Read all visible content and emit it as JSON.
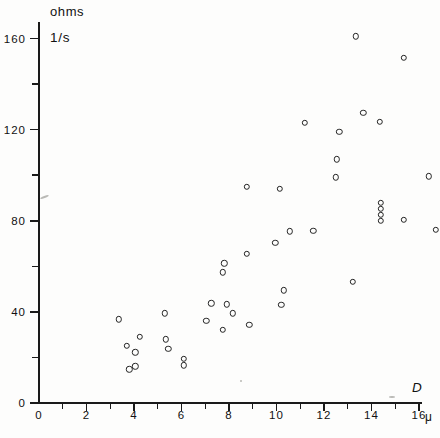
{
  "chart_data": {
    "type": "scatter",
    "title": "",
    "ylabel": "ohms",
    "ylabel_secondary": "1/s",
    "xlabel": "D",
    "xunit": "μ",
    "xlim": [
      0,
      16.8
    ],
    "ylim": [
      0,
      172
    ],
    "grid": false,
    "legend": null,
    "x_ticks_major": [
      0,
      2,
      4,
      6,
      8,
      10,
      12,
      14,
      16
    ],
    "x_ticks_minor": [
      1,
      3,
      5,
      7,
      9,
      11,
      13,
      15
    ],
    "y_ticks_major": [
      0,
      40,
      80,
      120,
      160
    ],
    "y_ticks_minor": [
      20,
      60,
      100,
      140
    ],
    "marker": "open-circle",
    "marker_color": "#242424",
    "points": [
      {
        "x": 3.35,
        "y": 36.7
      },
      {
        "x": 3.7,
        "y": 25.0
      },
      {
        "x": 3.8,
        "y": 14.8
      },
      {
        "x": 4.05,
        "y": 22.2
      },
      {
        "x": 4.25,
        "y": 29.0
      },
      {
        "x": 4.05,
        "y": 16.1
      },
      {
        "x": 5.3,
        "y": 39.3
      },
      {
        "x": 5.35,
        "y": 28.0
      },
      {
        "x": 5.45,
        "y": 23.9
      },
      {
        "x": 6.1,
        "y": 19.5
      },
      {
        "x": 6.1,
        "y": 16.5
      },
      {
        "x": 7.25,
        "y": 43.8
      },
      {
        "x": 7.9,
        "y": 43.3
      },
      {
        "x": 7.05,
        "y": 36.2
      },
      {
        "x": 8.15,
        "y": 39.4
      },
      {
        "x": 7.75,
        "y": 32.2
      },
      {
        "x": 8.85,
        "y": 34.2
      },
      {
        "x": 7.75,
        "y": 57.3
      },
      {
        "x": 7.8,
        "y": 61.4
      },
      {
        "x": 8.75,
        "y": 65.4
      },
      {
        "x": 8.75,
        "y": 94.8
      },
      {
        "x": 10.15,
        "y": 94.0
      },
      {
        "x": 9.95,
        "y": 70.2
      },
      {
        "x": 10.55,
        "y": 75.4
      },
      {
        "x": 11.55,
        "y": 75.6
      },
      {
        "x": 10.3,
        "y": 49.5
      },
      {
        "x": 10.2,
        "y": 43.2
      },
      {
        "x": 13.2,
        "y": 53.1
      },
      {
        "x": 11.2,
        "y": 123.0
      },
      {
        "x": 12.65,
        "y": 119.0
      },
      {
        "x": 13.35,
        "y": 161.0
      },
      {
        "x": 13.65,
        "y": 127.5
      },
      {
        "x": 14.35,
        "y": 123.5
      },
      {
        "x": 12.5,
        "y": 99.0
      },
      {
        "x": 12.55,
        "y": 107.0
      },
      {
        "x": 15.35,
        "y": 151.5
      },
      {
        "x": 16.4,
        "y": 99.5
      },
      {
        "x": 14.4,
        "y": 88.0
      },
      {
        "x": 14.4,
        "y": 85.3
      },
      {
        "x": 14.4,
        "y": 82.6
      },
      {
        "x": 14.4,
        "y": 80.0
      },
      {
        "x": 15.35,
        "y": 80.4
      },
      {
        "x": 16.7,
        "y": 76.1
      }
    ]
  }
}
